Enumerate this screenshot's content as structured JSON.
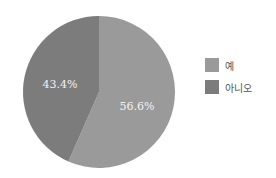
{
  "chart_data": {
    "type": "pie",
    "title": "",
    "categories": [
      "예",
      "아니오"
    ],
    "values": [
      56.6,
      43.4
    ],
    "labels": [
      "56.6%",
      "43.4%"
    ],
    "colors": [
      "#9a9a9a",
      "#7c7c7c"
    ],
    "start_angle": "12 o'clock, clockwise",
    "legend_position": "right"
  },
  "legend": {
    "items": [
      {
        "label": "예",
        "color": "#9a9a9a"
      },
      {
        "label": "아니오",
        "color": "#7c7c7c"
      }
    ]
  }
}
